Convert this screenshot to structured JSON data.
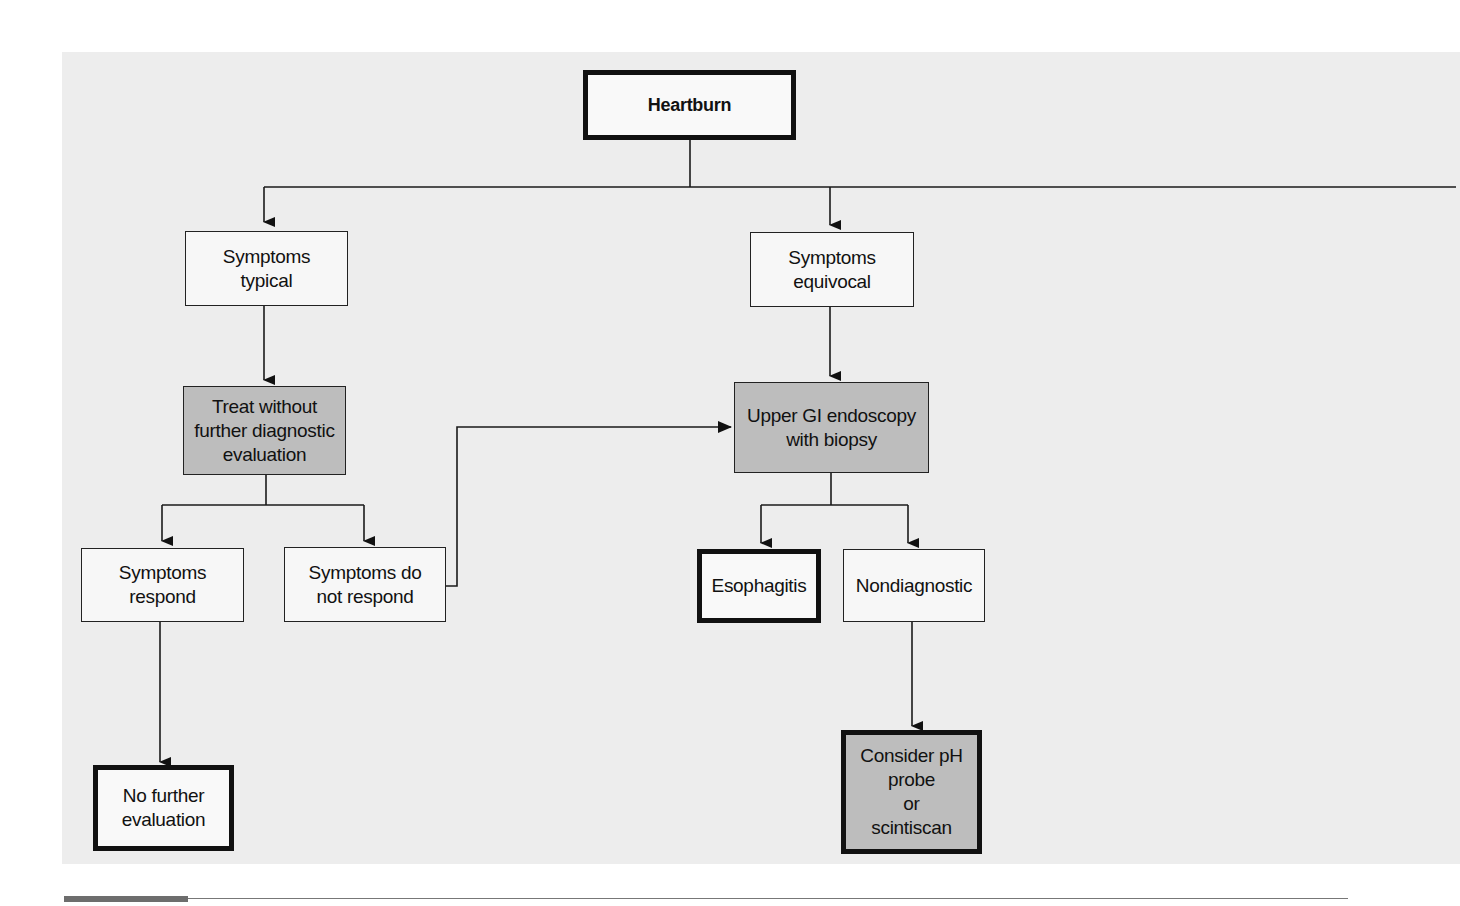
{
  "diagram": {
    "type": "flowchart",
    "root": "Heartburn",
    "colors": {
      "panel_background": "#ededed",
      "line": "#1a1a1a",
      "shaded_fill": "#bdbdbd",
      "plain_fill": "#f7f7f7"
    },
    "nodes": {
      "heartburn": {
        "label": "Heartburn",
        "style": "thick-border"
      },
      "symptoms_typical": {
        "label": "Symptoms\ntypical",
        "style": "thin-border"
      },
      "symptoms_equivocal": {
        "label": "Symptoms\nequivocal",
        "style": "thin-border"
      },
      "treat_without": {
        "label": "Treat without\nfurther diagnostic\nevaluation",
        "style": "shaded"
      },
      "upper_gi": {
        "label": "Upper GI endoscopy\nwith biopsy",
        "style": "shaded"
      },
      "symptoms_respond": {
        "label": "Symptoms\nrespond",
        "style": "thin-border"
      },
      "symptoms_not_respond": {
        "label": "Symptoms do\nnot respond",
        "style": "thin-border"
      },
      "esophagitis": {
        "label": "Esophagitis",
        "style": "thick-border"
      },
      "nondiagnostic": {
        "label": "Nondiagnostic",
        "style": "thin-border"
      },
      "no_further": {
        "label": "No further\nevaluation",
        "style": "thick-border"
      },
      "consider_ph": {
        "label": "Consider pH\nprobe\nor\nscintiscan",
        "style": "shaded-thick-border"
      }
    },
    "edges": [
      {
        "from": "Heartburn",
        "to": "Symptoms typical"
      },
      {
        "from": "Heartburn",
        "to": "Symptoms equivocal"
      },
      {
        "from": "Heartburn",
        "to": "(continues off-page right)"
      },
      {
        "from": "Symptoms typical",
        "to": "Treat without further diagnostic evaluation"
      },
      {
        "from": "Treat without further diagnostic evaluation",
        "to": "Symptoms respond"
      },
      {
        "from": "Treat without further diagnostic evaluation",
        "to": "Symptoms do not respond"
      },
      {
        "from": "Symptoms respond",
        "to": "No further evaluation"
      },
      {
        "from": "Symptoms do not respond",
        "to": "Upper GI endoscopy with biopsy"
      },
      {
        "from": "Symptoms equivocal",
        "to": "Upper GI endoscopy with biopsy"
      },
      {
        "from": "Upper GI endoscopy with biopsy",
        "to": "Esophagitis"
      },
      {
        "from": "Upper GI endoscopy with biopsy",
        "to": "Nondiagnostic"
      },
      {
        "from": "Nondiagnostic",
        "to": "Consider pH probe or scintiscan"
      }
    ]
  }
}
